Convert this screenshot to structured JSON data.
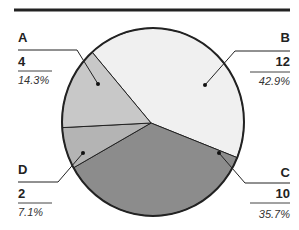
{
  "chart_data": {
    "type": "pie",
    "title": "",
    "categories": [
      "A",
      "B",
      "C",
      "D"
    ],
    "values": [
      4,
      12,
      10,
      2
    ],
    "percentages": [
      "14.3%",
      "42.9%",
      "35.7%",
      "7.1%"
    ],
    "colors": [
      "#c8c8c8",
      "#f0f0f0",
      "#8c8c8c",
      "#b4b4b4"
    ],
    "legend": "none (callout labels)",
    "total": 28
  },
  "labels": {
    "A": {
      "name": "A",
      "value": "4",
      "pct": "14.3%"
    },
    "B": {
      "name": "B",
      "value": "12",
      "pct": "42.9%"
    },
    "C": {
      "name": "C",
      "value": "10",
      "pct": "35.7%"
    },
    "D": {
      "name": "D",
      "value": "2",
      "pct": "7.1%"
    }
  }
}
